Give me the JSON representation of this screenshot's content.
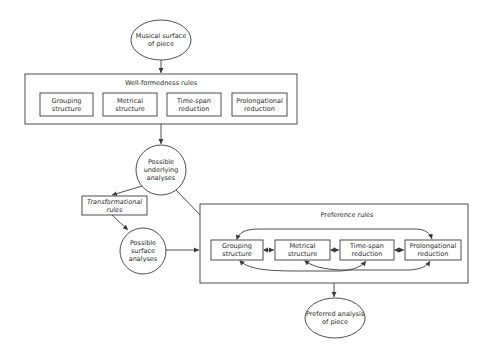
{
  "diagram": {
    "nodes": {
      "musical_surface": "Musical surface\nof piece",
      "wellformedness_title": "Well-formedness rules",
      "wf_grouping": "Grouping\nstructure",
      "wf_metrical": "Metrical\nstructure",
      "wf_timespan": "Time-span\nreduction",
      "wf_prolongational": "Prolongational\nreduction",
      "underlying_analyses": "Possible\nunderlying\nanalyses",
      "transformational_rules": "Transformational\nrules",
      "surface_analyses": "Possible\nsurface\nanalyses",
      "preference_title": "Preference rules",
      "pr_grouping": "Grouping\nstructure",
      "pr_metrical": "Metrical\nstructure",
      "pr_timespan": "Time-span\nreduction",
      "pr_prolongational": "Prolongational\nreduction",
      "preferred_analysis": "Preferred analysis\nof piece"
    },
    "edges": [
      {
        "from": "Musical surface of piece",
        "to": "Well-formedness rules"
      },
      {
        "from": "Well-formedness rules",
        "to": "Possible underlying analyses"
      },
      {
        "from": "Possible underlying analyses",
        "to": "Transformational rules"
      },
      {
        "from": "Possible underlying analyses",
        "to": "Preference rules"
      },
      {
        "from": "Transformational rules",
        "to": "Possible surface analyses"
      },
      {
        "from": "Possible surface analyses",
        "to": "Preference rules"
      },
      {
        "from": "Preference rules",
        "to": "Preferred analysis of piece"
      },
      {
        "from": "Grouping structure",
        "to": "Metrical structure",
        "bidirectional": true
      },
      {
        "from": "Metrical structure",
        "to": "Time-span reduction",
        "bidirectional": true
      },
      {
        "from": "Time-span reduction",
        "to": "Prolongational reduction",
        "bidirectional": true
      },
      {
        "from": "Grouping structure",
        "to": "Prolongational reduction",
        "bidirectional": true
      },
      {
        "from": "Grouping structure",
        "to": "Time-span reduction",
        "bidirectional": true
      },
      {
        "from": "Metrical structure",
        "to": "Prolongational reduction",
        "bidirectional": true
      }
    ],
    "colors": {
      "line": "#3a3a3a",
      "background": "#ffffff"
    }
  }
}
